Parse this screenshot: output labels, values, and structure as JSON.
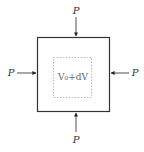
{
  "diagram": {
    "force_labels": {
      "top": "P",
      "bottom": "P",
      "left": "P",
      "right": "P"
    },
    "inner_label": "V₀+dV",
    "colors": {
      "outer_box": "#333333",
      "inner_box": "#aaaaaa",
      "arrow": "#222222",
      "text": "#333333"
    }
  }
}
